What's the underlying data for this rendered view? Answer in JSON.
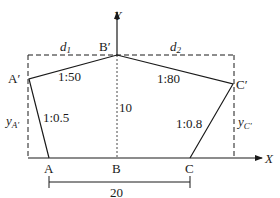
{
  "diagram": {
    "type": "cross-section geometry",
    "axes": {
      "x_label": "X",
      "y_label": "Y"
    },
    "points": {
      "A_prime": "A′",
      "B_prime": "B′",
      "C_prime": "C′",
      "A": "A",
      "B": "B",
      "C": "C"
    },
    "slopes": {
      "A_prime_B_prime": "1:50",
      "B_prime_C_prime": "1:80",
      "A_A_prime": "1:0.5",
      "C_C_prime": "1:0.8"
    },
    "dimensions": {
      "d1": "d",
      "d1_sub": "1",
      "d2": "d",
      "d2_sub": "2",
      "height_B": "10",
      "base_width": "20",
      "yA_main": "y",
      "yA_sub": "A′",
      "yC_main": "y",
      "yC_sub": "C′"
    },
    "colors": {
      "stroke": "#1a1a1a",
      "background": "#ffffff"
    }
  }
}
